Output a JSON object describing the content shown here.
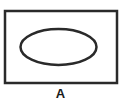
{
  "diagram": {
    "type": "venn",
    "universal_set": {
      "shape": "rectangle",
      "x": 5,
      "y": 11,
      "width": 112,
      "height": 72,
      "stroke": "#2a2a2a",
      "stroke_width": 2.5
    },
    "set": {
      "shape": "ellipse",
      "cx": 58.5,
      "cy": 47,
      "rx": 38,
      "ry": 18,
      "stroke": "#2a2a2a",
      "stroke_width": 2.5,
      "fill": "none"
    },
    "label": "A"
  }
}
